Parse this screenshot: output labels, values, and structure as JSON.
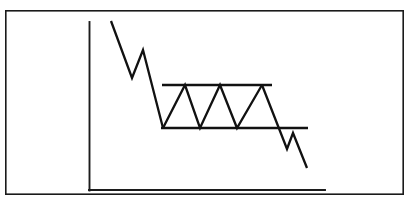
{
  "figure": {
    "title": "Bearish Rectangle Consolidation Pattern",
    "kind": "line-diagram",
    "background_color": "#ffffff",
    "stroke_color": "#111111",
    "border_color": "#1a1a1a"
  },
  "frame": {
    "name": "outer-border",
    "x": 5,
    "y": 10,
    "width": 399,
    "height": 185
  },
  "axes": {
    "y_axis": {
      "label": "",
      "x": 89,
      "y_top": 22,
      "y_bottom": 190
    },
    "x_axis": {
      "label": "",
      "y": 190,
      "x_left": 89,
      "x_right": 325
    },
    "ticks": [],
    "grid": false
  },
  "levels": {
    "resistance": {
      "label": "resistance",
      "y": 85,
      "x_start": 162,
      "x_end": 272
    },
    "support": {
      "label": "support",
      "y": 128,
      "x_start": 161,
      "x_end": 308
    }
  },
  "chart_data": {
    "type": "line",
    "title": "Bearish Rectangle Consolidation Pattern",
    "subtitle": "",
    "xlabel": "",
    "ylabel": "",
    "xlim": [
      89,
      325
    ],
    "ylim": [
      190,
      18
    ],
    "grid": false,
    "legend": "none",
    "annotations": [
      {
        "name": "resistance-level",
        "type": "hline",
        "y": 85,
        "x_start": 162,
        "x_end": 272
      },
      {
        "name": "support-level",
        "type": "hline",
        "y": 128,
        "x_start": 161,
        "x_end": 308
      }
    ],
    "series": [
      {
        "name": "price",
        "points": [
          [
            111,
            21
          ],
          [
            132,
            78
          ],
          [
            143,
            50
          ],
          [
            163,
            128
          ],
          [
            185,
            85
          ],
          [
            200,
            128
          ],
          [
            220,
            85
          ],
          [
            237,
            128
          ],
          [
            262,
            85
          ],
          [
            287,
            149
          ],
          [
            293,
            133
          ],
          [
            307,
            168
          ]
        ]
      }
    ]
  },
  "segments": {
    "downtrend_in": [
      [
        111,
        21
      ],
      [
        132,
        78
      ],
      [
        143,
        50
      ],
      [
        163,
        128
      ]
    ],
    "consolidation": [
      [
        163,
        128
      ],
      [
        185,
        85
      ],
      [
        200,
        128
      ],
      [
        220,
        85
      ],
      [
        237,
        128
      ],
      [
        262,
        85
      ]
    ],
    "breakdown": [
      [
        262,
        85
      ],
      [
        287,
        149
      ],
      [
        293,
        133
      ],
      [
        307,
        168
      ]
    ]
  }
}
